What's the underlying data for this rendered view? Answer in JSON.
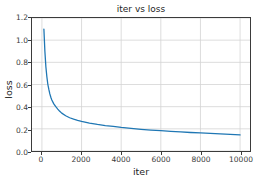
{
  "chart_data": {
    "type": "line",
    "title": "iter vs loss",
    "xlabel": "iter",
    "ylabel": "loss",
    "xlim": [
      -500,
      10500
    ],
    "ylim": [
      0.0,
      1.2
    ],
    "grid": true,
    "legend": null,
    "line_color": "#1f77b4",
    "x_ticks": [
      0,
      2000,
      4000,
      6000,
      8000,
      10000
    ],
    "x_tick_labels": [
      "0",
      "2000",
      "4000",
      "6000",
      "8000",
      "10000"
    ],
    "y_ticks": [
      0.0,
      0.2,
      0.4,
      0.6,
      0.8,
      1.0,
      1.2
    ],
    "y_tick_labels": [
      "0.0",
      "0.2",
      "0.4",
      "0.6",
      "0.8",
      "1.0",
      "1.2"
    ],
    "series": [
      {
        "name": "loss",
        "color": "#1f77b4",
        "x": [
          100,
          150,
          200,
          250,
          300,
          350,
          400,
          450,
          500,
          600,
          700,
          800,
          900,
          1000,
          1200,
          1400,
          1600,
          1800,
          2000,
          2400,
          2800,
          3200,
          3600,
          4000,
          4500,
          5000,
          5500,
          6000,
          6500,
          7000,
          7500,
          8000,
          8500,
          9000,
          9500,
          10000
        ],
        "y": [
          1.1,
          0.9,
          0.76,
          0.67,
          0.6,
          0.555,
          0.515,
          0.485,
          0.46,
          0.425,
          0.4,
          0.378,
          0.358,
          0.342,
          0.318,
          0.3,
          0.287,
          0.277,
          0.268,
          0.252,
          0.24,
          0.23,
          0.222,
          0.213,
          0.204,
          0.196,
          0.189,
          0.183,
          0.177,
          0.172,
          0.167,
          0.163,
          0.158,
          0.154,
          0.15,
          0.145
        ]
      }
    ]
  }
}
